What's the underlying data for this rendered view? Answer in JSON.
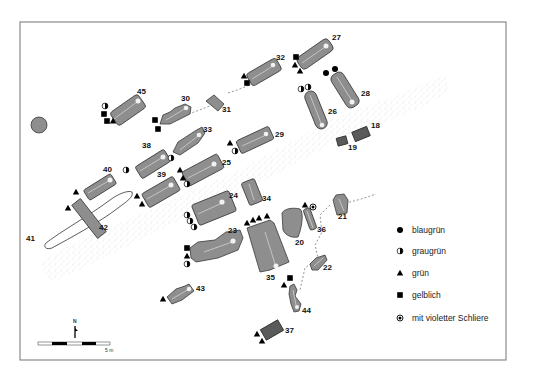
{
  "legend": {
    "items": [
      {
        "symbol": "circle-filled-icon",
        "label": "blaugrün"
      },
      {
        "symbol": "circle-half-icon",
        "label": "graugrün"
      },
      {
        "symbol": "triangle-filled-icon",
        "label": "grün"
      },
      {
        "symbol": "square-filled-icon",
        "label": "gelblich"
      },
      {
        "symbol": "circle-dot-icon",
        "label": "mit violetter Schliere"
      }
    ]
  },
  "scale_bar": {
    "label": "5 m"
  },
  "north_arrow": {
    "label": "N"
  },
  "graves": [
    {
      "id": "18",
      "label": "18",
      "symbols": []
    },
    {
      "id": "19",
      "label": "19",
      "symbols": []
    },
    {
      "id": "20",
      "label": "20",
      "symbols": []
    },
    {
      "id": "21",
      "label": "21",
      "symbols": []
    },
    {
      "id": "22",
      "label": "22",
      "symbols": []
    },
    {
      "id": "23",
      "label": "23",
      "symbols": [
        "square",
        "triangle",
        "half"
      ]
    },
    {
      "id": "24",
      "label": "24",
      "symbols": [
        "half",
        "half",
        "half"
      ]
    },
    {
      "id": "25",
      "label": "25",
      "symbols": [
        "triangle",
        "triangle",
        "half"
      ]
    },
    {
      "id": "26",
      "label": "26",
      "symbols": [
        "half",
        "half"
      ]
    },
    {
      "id": "27",
      "label": "27",
      "symbols": [
        "square",
        "triangle",
        "triangle"
      ]
    },
    {
      "id": "28",
      "label": "28",
      "symbols": [
        "circle",
        "circle"
      ]
    },
    {
      "id": "29",
      "label": "29",
      "symbols": [
        "triangle",
        "half"
      ]
    },
    {
      "id": "30",
      "label": "30",
      "symbols": [
        "square",
        "square"
      ]
    },
    {
      "id": "31",
      "label": "31",
      "symbols": []
    },
    {
      "id": "32",
      "label": "32",
      "symbols": [
        "triangle",
        "square"
      ]
    },
    {
      "id": "33",
      "label": "33",
      "symbols": [
        "half"
      ]
    },
    {
      "id": "34",
      "label": "34",
      "symbols": []
    },
    {
      "id": "35",
      "label": "35",
      "symbols": [
        "triangle",
        "triangle",
        "triangle",
        "triangle"
      ]
    },
    {
      "id": "36",
      "label": "36",
      "symbols": [
        "triangle",
        "dot"
      ]
    },
    {
      "id": "37",
      "label": "37",
      "symbols": [
        "triangle",
        "triangle"
      ]
    },
    {
      "id": "38",
      "label": "38",
      "symbols": [
        "half"
      ]
    },
    {
      "id": "39",
      "label": "39",
      "symbols": [
        "triangle",
        "triangle"
      ]
    },
    {
      "id": "40",
      "label": "40",
      "symbols": [
        "triangle"
      ]
    },
    {
      "id": "41",
      "label": "41",
      "symbols": []
    },
    {
      "id": "42",
      "label": "42",
      "symbols": [
        "triangle"
      ]
    },
    {
      "id": "43",
      "label": "43",
      "symbols": [
        "triangle"
      ]
    },
    {
      "id": "44",
      "label": "44",
      "symbols": [
        "square",
        "triangle"
      ]
    },
    {
      "id": "45",
      "label": "45",
      "symbols": [
        "half",
        "square",
        "square",
        "triangle"
      ]
    }
  ],
  "colors": {
    "grave_fill": "#8e8e8e",
    "grave_dark": "#5a5a5a",
    "frame": "#8a8a8a"
  }
}
